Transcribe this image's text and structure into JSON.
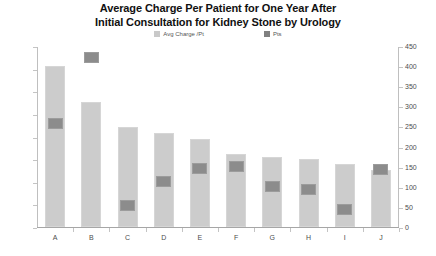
{
  "chart_data": {
    "type": "bar",
    "title": "Average Charge Per Patient for One Year After Initial Consultation for Kidney Stone by Urology",
    "title_lines": [
      "Average Charge Per Patient for One Year After",
      "Initial Consultation for Kidney Stone by Urology"
    ],
    "xlabel": "",
    "ylabel": "",
    "categories": [
      "A",
      "B",
      "C",
      "D",
      "E",
      "F",
      "G",
      "H",
      "I",
      "J"
    ],
    "series": [
      {
        "name": "Avg Charge /Pt",
        "axis": "left",
        "type": "bar",
        "color": "#cccccc",
        "values": [
          14230,
          11050,
          8840,
          8300,
          7780,
          6450,
          6190,
          6010,
          5570,
          5040
        ]
      },
      {
        "name": "Pts",
        "axis": "right",
        "type": "bar",
        "color": "#8c8c8c",
        "values": [
          261,
          425,
          57,
          116,
          149,
          154,
          102,
          95,
          45,
          145
        ]
      }
    ],
    "legend": [
      "Avg Charge /Pt",
      "Pts"
    ],
    "legend_position": "top-center",
    "grid": false,
    "left_axis": {
      "min": 0,
      "max": 16000,
      "step": 2000,
      "ticks": [
        "0",
        "2000",
        "4000",
        "6000",
        "8000",
        "10000",
        "12000",
        "14000",
        "16000"
      ]
    },
    "right_axis": {
      "min": 0,
      "max": 450,
      "step": 50,
      "ticks": [
        "0",
        "50",
        "100",
        "150",
        "200",
        "250",
        "300",
        "350",
        "400",
        "450"
      ]
    }
  }
}
